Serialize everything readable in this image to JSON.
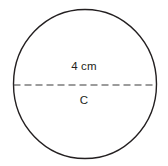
{
  "figure": {
    "type": "circle-diagram",
    "shape_name": "circle-outline",
    "stroke_color": "#231f20",
    "fill_color": "#ffffff",
    "background_color": "#ffffff",
    "circle": {
      "center_x": 85,
      "center_y": 84,
      "radius_x": 72,
      "radius_y": 75,
      "stroke_width": 1.4
    },
    "diameter_line": {
      "name": "dashed-diameter",
      "x1": 13,
      "y1": 85,
      "x2": 157,
      "y2": 85,
      "dash_length": 7,
      "gap_length": 4,
      "stroke_width": 1.2,
      "stroke_color": "#3a3a3a"
    },
    "labels": {
      "diameter": "4 cm",
      "circumference": "C"
    }
  }
}
